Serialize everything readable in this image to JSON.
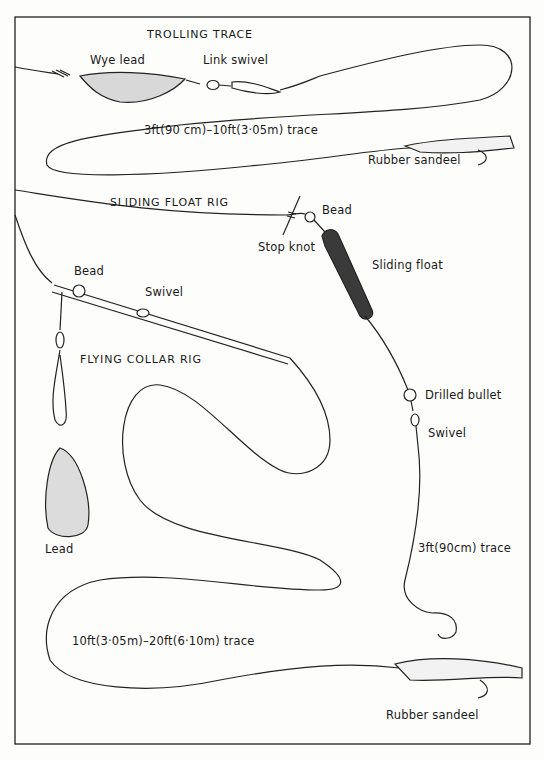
{
  "diagram": {
    "sections": [
      {
        "title": "TROLLING TRACE",
        "labels": {
          "wye_lead": "Wye lead",
          "link_swivel": "Link swivel",
          "trace": "3ft(90 cm)–10ft(3·05m) trace",
          "rubber_sandeel": "Rubber sandeel"
        }
      },
      {
        "title": "SLIDING FLOAT RIG",
        "labels": {
          "bead": "Bead",
          "stop_knot": "Stop knot",
          "sliding_float": "Sliding float",
          "drilled_bullet": "Drilled bullet",
          "swivel": "Swivel",
          "trace": "3ft(90cm) trace"
        }
      },
      {
        "title": "FLYING COLLAR RIG",
        "labels": {
          "bead": "Bead",
          "swivel": "Swivel",
          "lead": "Lead",
          "trace": "10ft(3·05m)–20ft(6·10m) trace",
          "rubber_sandeel": "Rubber sandeel"
        }
      }
    ]
  }
}
